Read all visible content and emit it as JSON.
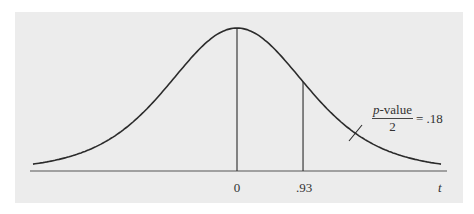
{
  "chart_data": {
    "type": "line",
    "title": "",
    "xlabel": "t",
    "ylabel": "",
    "x_ticks": [
      {
        "value": 0,
        "label": "0"
      },
      {
        "value": 0.93,
        "label": ".93"
      }
    ],
    "vertical_lines": [
      {
        "x": 0,
        "label": "0",
        "description": "center of distribution"
      },
      {
        "x": 0.93,
        "label": ".93",
        "description": "observed t statistic"
      }
    ],
    "annotation": {
      "numerator_italic": "p",
      "numerator_rest": "-value",
      "denominator": "2",
      "equals": "= .18",
      "value": 0.18,
      "points_to": "right tail area beyond t = .93"
    },
    "grid": false,
    "legend": null,
    "colors": {
      "curve": "#2b2b2b",
      "panel": "#ececec"
    }
  },
  "labels": {
    "tick_0": "0",
    "tick_093": ".93",
    "axis_var": "t"
  }
}
